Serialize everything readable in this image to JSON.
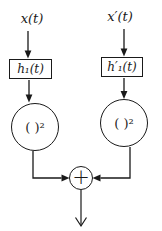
{
  "diagram": {
    "inputs": {
      "left_label": "x(t)",
      "right_label": "x′(t)"
    },
    "filters": {
      "left_label": "h₁(t)",
      "right_label": "h′₁(t)"
    },
    "squarers": {
      "left_label": "( )²",
      "right_label": "( )²"
    },
    "summer": {
      "symbol": "+"
    },
    "colors": {
      "line": "#1a1a1a",
      "background": "#ffffff"
    }
  }
}
